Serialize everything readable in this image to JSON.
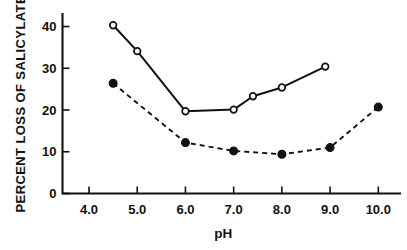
{
  "chart_data": {
    "type": "line",
    "title": "",
    "subtitle": "",
    "xlabel": "pH",
    "ylabel": "PERCENT LOSS OF SALICYLATE",
    "xlim": [
      3.45,
      10.45
    ],
    "ylim": [
      0,
      43
    ],
    "grid": false,
    "legend": "none",
    "xticks": [
      "4.0",
      "5.0",
      "6.0",
      "7.0",
      "8.0",
      "9.0",
      "10.0"
    ],
    "xtick_values": [
      4.0,
      5.0,
      6.0,
      7.0,
      8.0,
      9.0,
      10.0
    ],
    "yticks": [
      "0",
      "10",
      "20",
      "30",
      "40"
    ],
    "ytick_values": [
      0,
      10,
      20,
      30,
      40
    ],
    "series": [
      {
        "name": "open-circle-solid-line",
        "marker": "open-circle",
        "linestyle": "solid",
        "color": "#111111",
        "x": [
          4.5,
          5.0,
          6.0,
          7.0,
          7.4,
          8.0,
          8.9
        ],
        "values": [
          40.3,
          34.1,
          19.7,
          20.1,
          23.3,
          25.4,
          30.4
        ]
      },
      {
        "name": "filled-circle-dashed-line",
        "marker": "filled-circle",
        "linestyle": "dashed",
        "color": "#111111",
        "x": [
          4.5,
          6.0,
          7.0,
          8.0,
          9.0,
          10.0
        ],
        "values": [
          26.4,
          12.2,
          10.2,
          9.4,
          11.0,
          20.7
        ]
      }
    ]
  }
}
